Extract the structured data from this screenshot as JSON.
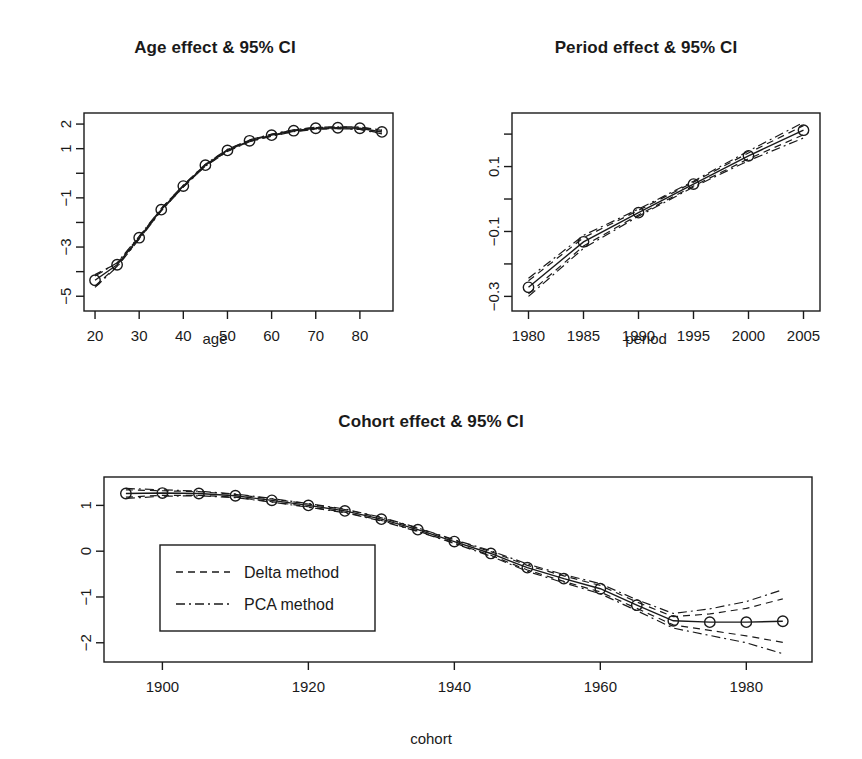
{
  "figure": {
    "background": "#ffffff",
    "ink": "#1a1a1a"
  },
  "panels": {
    "age": {
      "title": "Age effect & 95% CI",
      "xlabel": "age",
      "ylabel": "",
      "x_ticks": [
        "20",
        "30",
        "40",
        "50",
        "60",
        "70",
        "80"
      ],
      "y_ticks": [
        "2",
        "1",
        "",
        "-1",
        "",
        "-3",
        "",
        "-5"
      ]
    },
    "period": {
      "title": "Period effect & 95% CI",
      "xlabel": "period",
      "ylabel": "",
      "x_ticks": [
        "1980",
        "1985",
        "1990",
        "1995",
        "2000",
        "2005"
      ],
      "y_ticks": [
        "",
        "0.1",
        "",
        "-0.1",
        "",
        "-0.3"
      ]
    },
    "cohort": {
      "title": "Cohort effect & 95% CI",
      "xlabel": "cohort",
      "ylabel": "",
      "x_ticks": [
        "1900",
        "1920",
        "1940",
        "1960",
        "1980"
      ],
      "y_ticks": [
        "1",
        "0",
        "-1",
        "-2"
      ],
      "legend": {
        "items": [
          {
            "label": "Delta method",
            "style": "dashed"
          },
          {
            "label": "PCA method",
            "style": "dashdot"
          }
        ]
      }
    }
  },
  "chart_data": [
    {
      "id": "age",
      "type": "line",
      "title": "Age effect & 95% CI",
      "xlabel": "age",
      "ylabel": "",
      "xlim": [
        17.5,
        87.5
      ],
      "ylim": [
        -5.6,
        2.45
      ],
      "xticks": [
        20,
        30,
        40,
        50,
        60,
        70,
        80
      ],
      "yticks": [
        2,
        1,
        0,
        -1,
        -2,
        -3,
        -4,
        -5
      ],
      "ytick_labels": [
        "2",
        "1",
        "",
        "-1",
        "",
        "-3",
        "",
        "-5"
      ],
      "grid": false,
      "legend": null,
      "x": [
        20,
        25,
        30,
        35,
        40,
        45,
        50,
        55,
        60,
        65,
        70,
        75,
        80,
        85
      ],
      "series": [
        {
          "name": "estimate",
          "style": "solid",
          "markers": "circle",
          "values": [
            -4.35,
            -3.72,
            -2.62,
            -1.48,
            -0.52,
            0.33,
            0.93,
            1.32,
            1.55,
            1.73,
            1.83,
            1.85,
            1.83,
            1.68
          ]
        },
        {
          "name": "Delta method upper",
          "style": "dashed",
          "values": [
            -4.12,
            -3.66,
            -2.58,
            -1.44,
            -0.49,
            0.36,
            0.96,
            1.35,
            1.58,
            1.76,
            1.86,
            1.88,
            1.87,
            1.74
          ]
        },
        {
          "name": "Delta method lower",
          "style": "dashed",
          "values": [
            -4.58,
            -3.78,
            -2.66,
            -1.52,
            -0.55,
            0.3,
            0.9,
            1.29,
            1.52,
            1.7,
            1.8,
            1.82,
            1.79,
            1.62
          ]
        },
        {
          "name": "PCA method upper",
          "style": "dashdot",
          "values": [
            -4.18,
            -3.64,
            -2.56,
            -1.43,
            -0.48,
            0.37,
            0.97,
            1.36,
            1.59,
            1.77,
            1.87,
            1.89,
            1.88,
            1.76
          ]
        },
        {
          "name": "PCA method lower",
          "style": "dashdot",
          "values": [
            -4.64,
            -3.8,
            -2.68,
            -1.53,
            -0.56,
            0.29,
            0.89,
            1.28,
            1.51,
            1.69,
            1.79,
            1.81,
            1.78,
            1.6
          ]
        }
      ]
    },
    {
      "id": "period",
      "type": "line",
      "title": "Period effect & 95% CI",
      "xlabel": "period",
      "ylabel": "",
      "xlim": [
        1978.5,
        2006.5
      ],
      "ylim": [
        -0.345,
        0.265
      ],
      "xticks": [
        1980,
        1985,
        1990,
        1995,
        2000,
        2005
      ],
      "yticks": [
        0.2,
        0.1,
        0.0,
        -0.1,
        -0.2,
        -0.3
      ],
      "ytick_labels": [
        "",
        "0.1",
        "",
        "-0.1",
        "",
        "-0.3"
      ],
      "grid": false,
      "legend": null,
      "x": [
        1980,
        1985,
        1990,
        1995,
        2000,
        2005
      ],
      "series": [
        {
          "name": "estimate",
          "style": "solid",
          "markers": "circle",
          "values": [
            -0.272,
            -0.132,
            -0.042,
            0.046,
            0.133,
            0.212
          ]
        },
        {
          "name": "Delta method upper",
          "style": "dashed",
          "values": [
            -0.252,
            -0.119,
            -0.035,
            0.052,
            0.142,
            0.226
          ]
        },
        {
          "name": "Delta method lower",
          "style": "dashed",
          "values": [
            -0.292,
            -0.145,
            -0.049,
            0.04,
            0.124,
            0.198
          ]
        },
        {
          "name": "PCA method upper",
          "style": "dashdot",
          "values": [
            -0.244,
            -0.112,
            -0.031,
            0.055,
            0.148,
            0.236
          ]
        },
        {
          "name": "PCA method lower",
          "style": "dashdot",
          "values": [
            -0.3,
            -0.152,
            -0.053,
            0.037,
            0.118,
            0.188
          ]
        }
      ]
    },
    {
      "id": "cohort",
      "type": "line",
      "title": "Cohort effect & 95% CI",
      "xlabel": "cohort",
      "ylabel": "",
      "xlim": [
        1892,
        1989
      ],
      "ylim": [
        -2.42,
        1.62
      ],
      "xticks": [
        1900,
        1920,
        1940,
        1960,
        1980
      ],
      "yticks": [
        1,
        0,
        -1,
        -2
      ],
      "ytick_labels": [
        "1",
        "0",
        "-1",
        "-2"
      ],
      "grid": false,
      "legend": {
        "position": "center-left",
        "items": [
          "Delta method",
          "PCA method"
        ]
      },
      "x": [
        1895,
        1900,
        1905,
        1910,
        1915,
        1920,
        1925,
        1930,
        1935,
        1940,
        1945,
        1950,
        1955,
        1960,
        1965,
        1970,
        1975,
        1980,
        1985
      ],
      "series": [
        {
          "name": "estimate",
          "style": "solid",
          "markers": "circle",
          "values": [
            1.26,
            1.27,
            1.26,
            1.21,
            1.11,
            1.0,
            0.88,
            0.7,
            0.47,
            0.21,
            -0.05,
            -0.36,
            -0.6,
            -0.82,
            -1.18,
            -1.52,
            -1.55,
            -1.55,
            -1.53
          ]
        },
        {
          "name": "Delta method upper",
          "style": "dashed",
          "values": [
            1.34,
            1.32,
            1.3,
            1.24,
            1.14,
            1.03,
            0.91,
            0.73,
            0.5,
            0.24,
            -0.01,
            -0.31,
            -0.54,
            -0.75,
            -1.11,
            -1.43,
            -1.37,
            -1.25,
            -1.04
          ]
        },
        {
          "name": "Delta method lower",
          "style": "dashed",
          "values": [
            1.18,
            1.22,
            1.22,
            1.18,
            1.08,
            0.97,
            0.85,
            0.67,
            0.44,
            0.18,
            -0.09,
            -0.41,
            -0.66,
            -0.89,
            -1.25,
            -1.61,
            -1.73,
            -1.85,
            -1.99
          ]
        },
        {
          "name": "PCA method upper",
          "style": "dashdot",
          "values": [
            1.37,
            1.34,
            1.31,
            1.25,
            1.15,
            1.04,
            0.92,
            0.74,
            0.51,
            0.25,
            0.01,
            -0.28,
            -0.51,
            -0.71,
            -1.06,
            -1.36,
            -1.26,
            -1.1,
            -0.84
          ]
        },
        {
          "name": "PCA method lower",
          "style": "dashdot",
          "values": [
            1.15,
            1.2,
            1.21,
            1.17,
            1.07,
            0.96,
            0.84,
            0.66,
            0.43,
            0.17,
            -0.11,
            -0.44,
            -0.69,
            -0.93,
            -1.3,
            -1.68,
            -1.84,
            -2.0,
            -2.24
          ]
        }
      ]
    }
  ]
}
